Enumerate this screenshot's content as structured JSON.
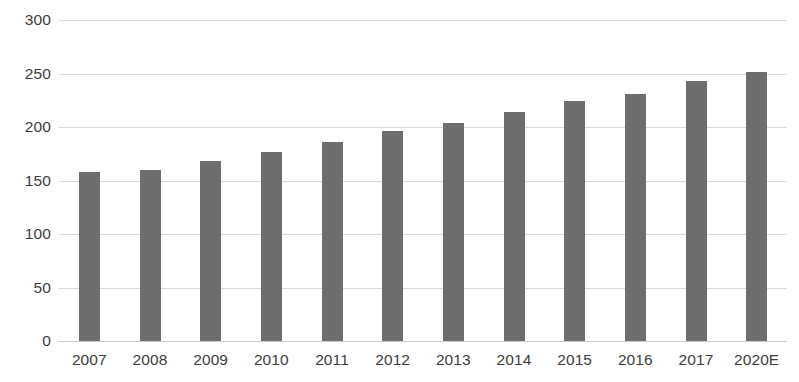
{
  "chart_data": {
    "type": "bar",
    "title": "",
    "subtitle": "",
    "xlabel": "",
    "ylabel": "",
    "categories": [
      "2007",
      "2008",
      "2009",
      "2010",
      "2011",
      "2012",
      "2013",
      "2014",
      "2015",
      "2016",
      "2017",
      "2020E"
    ],
    "values": [
      158,
      160,
      168,
      177,
      186,
      196,
      204,
      214,
      224,
      231,
      243,
      251
    ],
    "series": [
      {
        "name": "",
        "values": [
          158,
          160,
          168,
          177,
          186,
          196,
          204,
          214,
          224,
          231,
          243,
          251
        ]
      }
    ],
    "ylim": [
      0,
      300
    ],
    "yticks": [
      0,
      50,
      100,
      150,
      200,
      250,
      300
    ],
    "ytick_labels": [
      "0",
      "50",
      "100",
      "150",
      "200",
      "250",
      "300"
    ],
    "grid": true,
    "grid_axis": "y",
    "legend": false,
    "legend_position": "none",
    "annotations": [],
    "colors": {
      "bar": "#6e6e6e",
      "gridline": "#d9d9d9",
      "baseline": "#c9c9c9",
      "tick_label": "#3d3d3d",
      "background": "#ffffff"
    },
    "bar_width_px": 21
  }
}
